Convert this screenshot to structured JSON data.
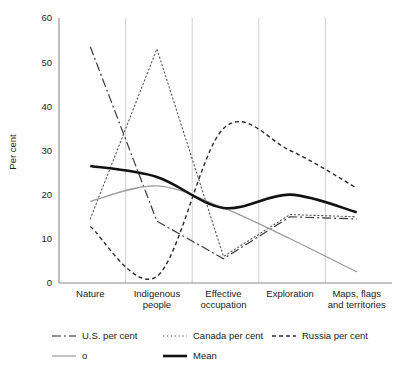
{
  "chart_data": {
    "type": "line",
    "title": "",
    "xlabel": "",
    "ylabel": "Per cent",
    "ylim": [
      0,
      60
    ],
    "yticks": [
      0,
      10,
      20,
      30,
      40,
      50,
      60
    ],
    "grid": "vertical-category-lines",
    "legend_position": "bottom",
    "categories": [
      "Nature",
      "Indigenous people",
      "Effective occupation",
      "Exploration",
      "Maps, flags and territories"
    ],
    "category_lines": [
      [
        "Nature"
      ],
      [
        "Indigenous",
        "people"
      ],
      [
        "Effective",
        "occupation"
      ],
      [
        "Exploration"
      ],
      [
        "Maps, flags",
        "and territories"
      ]
    ],
    "series": [
      {
        "name": "U.S. per cent",
        "style": "dashdot",
        "color": "#3a3a3a",
        "width": 1.2,
        "smooth": false,
        "values": [
          53.5,
          14.0,
          5.5,
          15.0,
          14.5
        ]
      },
      {
        "name": "Canada per cent",
        "style": "dotted",
        "color": "#555555",
        "width": 1.1,
        "smooth": false,
        "values": [
          14.5,
          53.0,
          6.0,
          15.5,
          15.0
        ]
      },
      {
        "name": "Russia per cent",
        "style": "dashed",
        "color": "#2b2b2b",
        "width": 1.4,
        "smooth": true,
        "values": [
          12.8,
          1.5,
          35.0,
          30.0,
          21.5
        ]
      },
      {
        "name": "o",
        "style": "solid-thin",
        "color": "#9a9a9a",
        "width": 1.2,
        "smooth": true,
        "values": [
          18.5,
          22.0,
          17.0,
          10.0,
          2.5
        ]
      },
      {
        "name": "Mean",
        "style": "solid-thick",
        "color": "#111111",
        "width": 2.6,
        "smooth": true,
        "values": [
          26.5,
          24.0,
          17.0,
          20.0,
          16.0
        ]
      }
    ]
  },
  "axis": {
    "y_title": "Per cent",
    "y_tick_labels": [
      "60",
      "50",
      "40",
      "30",
      "20",
      "10",
      "0"
    ]
  },
  "legend": {
    "row1": [
      {
        "label": "U.S. per cent",
        "style": "dashdot"
      },
      {
        "label": "Canada per cent",
        "style": "dotted"
      },
      {
        "label": "Russia per cent",
        "style": "dashed"
      }
    ],
    "row2": [
      {
        "label": "o",
        "style": "solid-thin"
      },
      {
        "label": "Mean",
        "style": "solid-thick"
      }
    ]
  },
  "colors": {
    "axis": "#8a8a8a",
    "gridline": "#cfcfcf",
    "text": "#1a1a1a",
    "mean": "#111111",
    "o_series": "#9a9a9a"
  }
}
